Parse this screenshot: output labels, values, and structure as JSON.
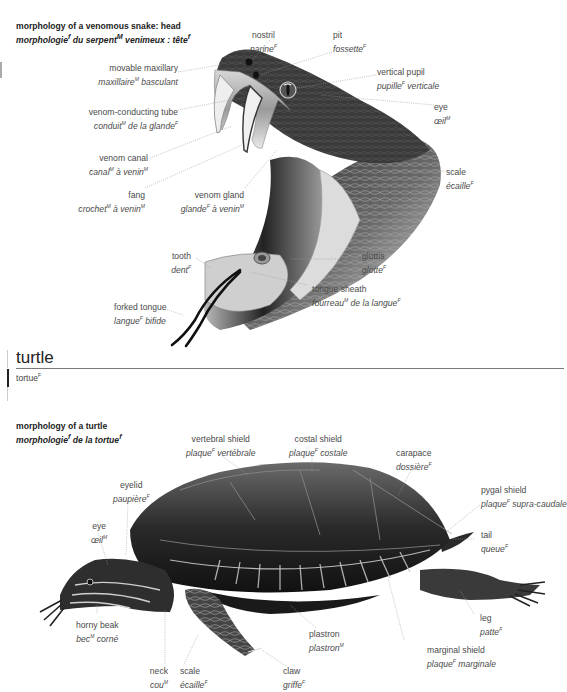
{
  "snake": {
    "title_en": "morphology of a venomous snake: head",
    "title_fr": "morphologie",
    "title_fr_parts": [
      "morphologie",
      "f",
      " du serpent",
      "M",
      " venimeux : tête",
      "f"
    ],
    "labels": [
      {
        "id": "nostril",
        "en": "nostril",
        "fr": "narine",
        "g": "F"
      },
      {
        "id": "pit",
        "en": "pit",
        "fr": "fossette",
        "g": "F"
      },
      {
        "id": "movable-maxillary",
        "en": "movable maxillary",
        "fr": "maxillaire",
        "g": "M",
        "fr2": " basculant"
      },
      {
        "id": "vertical-pupil",
        "en": "vertical pupil",
        "fr": "pupille",
        "g": "F",
        "fr2": " verticale"
      },
      {
        "id": "eye",
        "en": "eye",
        "fr": "œil",
        "g": "M"
      },
      {
        "id": "venom-conducting-tube",
        "en": "venom-conducting tube",
        "fr": "conduit",
        "g": "M",
        "fr2": " de la glande",
        "g2": "F"
      },
      {
        "id": "venom-canal",
        "en": "venom canal",
        "fr": "canal",
        "g": "M",
        "fr2": " à venin",
        "g2": "M"
      },
      {
        "id": "fang",
        "en": "fang",
        "fr": "crochet",
        "g": "M",
        "fr2": " à venin",
        "g2": "M"
      },
      {
        "id": "venom-gland",
        "en": "venom gland",
        "fr": "glande",
        "g": "F",
        "fr2": " à venin",
        "g2": "M"
      },
      {
        "id": "scale",
        "en": "scale",
        "fr": "écaille",
        "g": "F"
      },
      {
        "id": "tooth",
        "en": "tooth",
        "fr": "dent",
        "g": "F"
      },
      {
        "id": "glottis",
        "en": "glottis",
        "fr": "glotte",
        "g": "F"
      },
      {
        "id": "tongue-sheath",
        "en": "tongue sheath",
        "fr": "fourreau",
        "g": "M",
        "fr2": " de la langue",
        "g2": "F"
      },
      {
        "id": "forked-tongue",
        "en": "forked tongue",
        "fr": "langue",
        "g": "F",
        "fr2": " bifide"
      }
    ]
  },
  "section": {
    "heading": "turtle",
    "subheading": "tortue",
    "sub_g": "F"
  },
  "turtle": {
    "title_en": "morphology of a turtle",
    "title_fr_parts": [
      "morphologie",
      "f",
      " de la tortue",
      "f"
    ],
    "labels": [
      {
        "id": "vertebral-shield",
        "en": "vertebral shield",
        "fr": "plaque",
        "g": "F",
        "fr2": " vertébrale"
      },
      {
        "id": "costal-shield",
        "en": "costal shield",
        "fr": "plaque",
        "g": "F",
        "fr2": " costale"
      },
      {
        "id": "carapace",
        "en": "carapace",
        "fr": "dossière",
        "g": "F"
      },
      {
        "id": "eyelid",
        "en": "eyelid",
        "fr": "paupière",
        "g": "F"
      },
      {
        "id": "pygal-shield",
        "en": "pygal shield",
        "fr": "plaque",
        "g": "F",
        "fr2": " supra-caudale"
      },
      {
        "id": "eye",
        "en": "eye",
        "fr": "œil",
        "g": "M"
      },
      {
        "id": "tail",
        "en": "tail",
        "fr": "queue",
        "g": "F"
      },
      {
        "id": "horny-beak",
        "en": "horny beak",
        "fr": "bec",
        "g": "M",
        "fr2": " corné"
      },
      {
        "id": "leg",
        "en": "leg",
        "fr": "patte",
        "g": "F"
      },
      {
        "id": "plastron",
        "en": "plastron",
        "fr": "plastron",
        "g": "M"
      },
      {
        "id": "marginal-shield",
        "en": "marginal shield",
        "fr": "plaque",
        "g": "F",
        "fr2": " marginale"
      },
      {
        "id": "neck",
        "en": "neck",
        "fr": "cou",
        "g": "M"
      },
      {
        "id": "scale",
        "en": "scale",
        "fr": "écaille",
        "g": "F"
      },
      {
        "id": "claw",
        "en": "claw",
        "fr": "griffe",
        "g": "F"
      }
    ]
  },
  "colors": {
    "text": "#4a4a4a",
    "title": "#222222",
    "rule": "#7a7a7a",
    "leader": "#9a9a9a"
  }
}
